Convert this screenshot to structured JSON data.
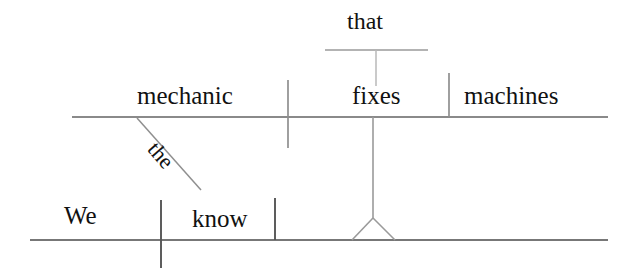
{
  "diagram": {
    "type": "reed-kellogg-sentence-diagram",
    "sentence": "We know that the mechanic fixes machines.",
    "canvas": {
      "width": 635,
      "height": 279,
      "background": "#ffffff"
    },
    "ink_color": "#7d7d7d",
    "text_color": "#111111",
    "words": {
      "that": "that",
      "mechanic": "mechanic",
      "fixes": "fixes",
      "machines": "machines",
      "the": "the",
      "we": "We",
      "know": "know"
    },
    "lines": {
      "main_clause_baseline": {
        "x1": 30,
        "y1": 240,
        "x2": 608,
        "y2": 240
      },
      "subordinate_clause_baseline": {
        "x1": 72,
        "y1": 117,
        "x2": 608,
        "y2": 117
      },
      "that_baseline": {
        "x1": 325,
        "y1": 50,
        "x2": 428,
        "y2": 50
      },
      "that_connector": {
        "x1": 376,
        "y1": 50,
        "x2": 376,
        "y2": 86
      },
      "main_subject_verb_divider": {
        "x1": 161,
        "y1": 200,
        "x2": 161,
        "y2": 268
      },
      "main_verb_object_divider": {
        "x1": 275,
        "y1": 198,
        "x2": 275,
        "y2": 240
      },
      "sub_subject_verb_divider": {
        "x1": 288,
        "y1": 80,
        "x2": 288,
        "y2": 148
      },
      "sub_verb_object_divider": {
        "x1": 449,
        "y1": 73,
        "x2": 449,
        "y2": 117
      },
      "article_modifier_slant": {
        "x1": 137,
        "y1": 118,
        "x2": 201,
        "y2": 190
      },
      "clause_stem": {
        "x1": 373,
        "y1": 117,
        "x2": 373,
        "y2": 218
      },
      "clause_tripod_left": {
        "x1": 373,
        "y1": 218,
        "x2": 352,
        "y2": 240
      },
      "clause_tripod_right": {
        "x1": 373,
        "y1": 218,
        "x2": 395,
        "y2": 240
      }
    }
  }
}
